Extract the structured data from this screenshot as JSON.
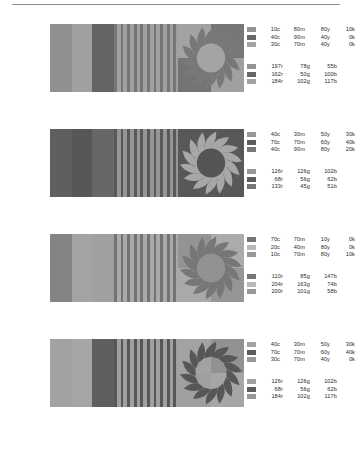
{
  "figure": {
    "title_rule": "horizontal-rule",
    "rows": [
      {
        "id": "row-1",
        "panel_blocks": {
          "name": "three-color-blocks",
          "colors": [
            "#8a8a8a",
            "#9b9b9b",
            "#5a5a5a"
          ],
          "widths": [
            34,
            30,
            36
          ]
        },
        "panel_stripes": {
          "name": "vertical-stripes",
          "base": "#9a9a9a",
          "stripe": "#6d6d6d",
          "count": 10
        },
        "panel_sun": {
          "name": "sun-graphic",
          "quadrants": [
            "#9d9d9d",
            "#6f6f6f",
            "#6b6b6b",
            "#9a9a9a"
          ],
          "ray_color": "#707070",
          "disk_color": "#9e9e9e",
          "disk": true
        },
        "cmyk": [
          {
            "swatch": "#8a8a8a",
            "c": "10c",
            "m": "80m",
            "y": "80y",
            "k": "10k"
          },
          {
            "swatch": "#5a5a5a",
            "c": "40c",
            "m": "90m",
            "y": "40y",
            "k": "0k"
          },
          {
            "swatch": "#9b9b9b",
            "c": "30c",
            "m": "70m",
            "y": "40y",
            "k": "0k"
          }
        ],
        "rgb": [
          {
            "swatch": "#8a8a8a",
            "r": "197r",
            "g": "78g",
            "b": "55b"
          },
          {
            "swatch": "#5a5a5a",
            "r": "162r",
            "g": "50g",
            "b": "100b"
          },
          {
            "swatch": "#9b9b9b",
            "r": "184r",
            "g": "102g",
            "b": "117b"
          }
        ]
      },
      {
        "id": "row-2",
        "panel_blocks": {
          "name": "three-color-blocks",
          "colors": [
            "#555555",
            "#4d4d4d",
            "#5e5e5e"
          ],
          "widths": [
            34,
            30,
            36
          ]
        },
        "panel_stripes": {
          "name": "vertical-stripes",
          "base": "#8f8f8f",
          "stripe": "#4f4f4f",
          "count": 10
        },
        "panel_sun": {
          "name": "sun-graphic",
          "quadrants": [
            "#4e4e4e",
            "#4e4e4e",
            "#4e4e4e",
            "#4e4e4e"
          ],
          "ray_color": "#a2a2a2",
          "disk_color": "#4a4a4a",
          "disk": true
        },
        "cmyk": [
          {
            "swatch": "#8f8f8f",
            "c": "40c",
            "m": "30m",
            "y": "50y",
            "k": "30k"
          },
          {
            "swatch": "#4e4e4e",
            "c": "70c",
            "m": "70m",
            "y": "60y",
            "k": "40k"
          },
          {
            "swatch": "#6b6b6b",
            "c": "40c",
            "m": "90m",
            "y": "80y",
            "k": "20k"
          }
        ],
        "rgb": [
          {
            "swatch": "#8f8f8f",
            "r": "126r",
            "g": "126g",
            "b": "102b"
          },
          {
            "swatch": "#4e4e4e",
            "r": "68r",
            "g": "56g",
            "b": "62b"
          },
          {
            "swatch": "#6b6b6b",
            "r": "133r",
            "g": "45g",
            "b": "51b"
          }
        ]
      },
      {
        "id": "row-3",
        "panel_blocks": {
          "name": "three-color-blocks",
          "colors": [
            "#7c7c7c",
            "#9e9e9e",
            "#9a9a9a"
          ],
          "widths": [
            34,
            30,
            36
          ]
        },
        "panel_stripes": {
          "name": "vertical-stripes",
          "base": "#a4a4a4",
          "stripe": "#6a6a6a",
          "count": 10
        },
        "panel_sun": {
          "name": "sun-graphic",
          "quadrants": [
            "#8d8d8d",
            "#a6a6a6",
            "#a4a4a4",
            "#8f8f8f"
          ],
          "ray_color": "#6e6e6e",
          "disk_color": "#8b8b8b",
          "disk": true
        },
        "cmyk": [
          {
            "swatch": "#6a6a6a",
            "c": "70c",
            "m": "70m",
            "y": "10y",
            "k": "0k"
          },
          {
            "swatch": "#b4b4b4",
            "c": "20c",
            "m": "40m",
            "y": "80y",
            "k": "0k"
          },
          {
            "swatch": "#8f8f8f",
            "c": "10c",
            "m": "70m",
            "y": "80y",
            "k": "10k"
          }
        ],
        "rgb": [
          {
            "swatch": "#6a6a6a",
            "r": "110r",
            "g": "85g",
            "b": "147b"
          },
          {
            "swatch": "#b4b4b4",
            "r": "204r",
            "g": "163g",
            "b": "74b"
          },
          {
            "swatch": "#8f8f8f",
            "r": "200r",
            "g": "101g",
            "b": "58b"
          }
        ]
      },
      {
        "id": "row-4",
        "panel_blocks": {
          "name": "three-color-blocks",
          "colors": [
            "#9c9c9c",
            "#a0a0a0",
            "#555555"
          ],
          "widths": [
            34,
            30,
            36
          ]
        },
        "panel_stripes": {
          "name": "vertical-stripes",
          "base": "#9a9a9a",
          "stripe": "#4d4d4d",
          "count": 10
        },
        "panel_sun": {
          "name": "sun-graphic",
          "quadrants": [
            "#9d9d9d",
            "#8b8b8b",
            "#9a9a9a",
            "#a0a0a0"
          ],
          "ray_color": "#4c4c4c",
          "disk_color": "#9d9d9d",
          "disk": false
        },
        "cmyk": [
          {
            "swatch": "#9a9a9a",
            "c": "40c",
            "m": "30m",
            "y": "50y",
            "k": "30k"
          },
          {
            "swatch": "#4e4e4e",
            "c": "70c",
            "m": "70m",
            "y": "60y",
            "k": "40k"
          },
          {
            "swatch": "#8f8f8f",
            "c": "30c",
            "m": "70m",
            "y": "40y",
            "k": "0k"
          }
        ],
        "rgb": [
          {
            "swatch": "#9a9a9a",
            "r": "126r",
            "g": "126g",
            "b": "102b"
          },
          {
            "swatch": "#4e4e4e",
            "r": "68r",
            "g": "56g",
            "b": "62b"
          },
          {
            "swatch": "#8f8f8f",
            "r": "184r",
            "g": "102g",
            "b": "117b"
          }
        ]
      }
    ]
  }
}
